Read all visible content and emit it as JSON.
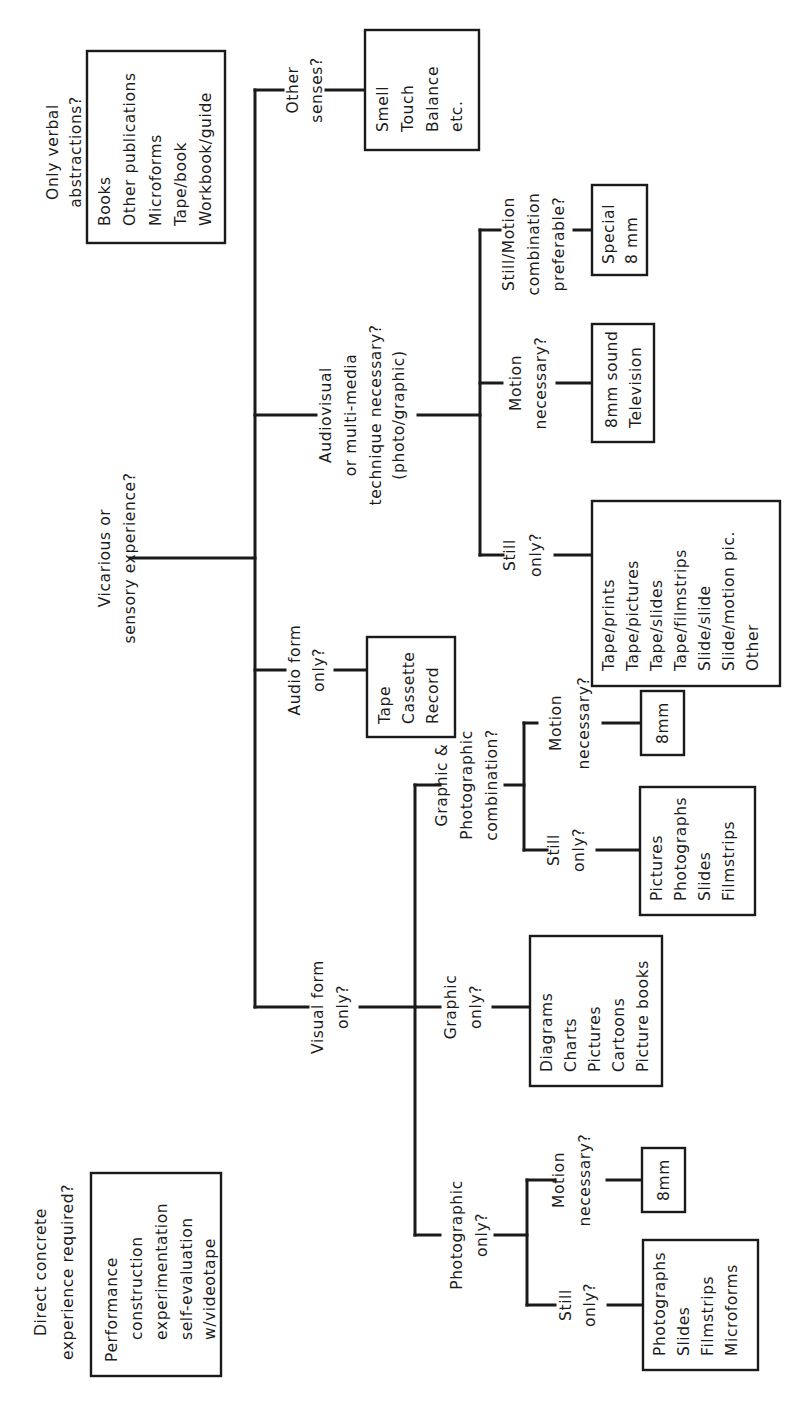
{
  "diagram": {
    "orientation": "rotated -90deg (text reads bottom-to-top)",
    "colors": {
      "ink": "#1a1a1a",
      "background": "#ffffff"
    },
    "questions": {
      "direct": [
        "Direct concrete",
        "experience required?"
      ],
      "vicarious": [
        "Vicarious or",
        "sensory experience?"
      ],
      "verbal": [
        "Only verbal",
        "abstractions?"
      ],
      "visual": [
        "Visual form",
        "only?"
      ],
      "audio": [
        "Audio form",
        "only?"
      ],
      "audiovisual": [
        "Audiovisual",
        "or multi-media",
        "technique necessary?",
        "(photo/graphic)"
      ],
      "other_senses": [
        "Other",
        "senses?"
      ],
      "photographic": [
        "Photographic",
        "only?"
      ],
      "graphic": [
        "Graphic",
        "only?"
      ],
      "graphic_photo": [
        "Graphic &",
        "Photographic",
        "combination?"
      ],
      "photo_still": [
        "Still",
        "only?"
      ],
      "photo_motion": [
        "Motion",
        "necessary?"
      ],
      "gp_still": [
        "Still",
        "only?"
      ],
      "gp_motion": [
        "Motion",
        "necessary?"
      ],
      "av_still": [
        "Still",
        "only?"
      ],
      "av_motion": [
        "Motion",
        "necessary?"
      ],
      "av_combo": [
        "Still/Motion",
        "combination",
        "preferable?"
      ]
    },
    "boxes": {
      "direct": [
        "Performance",
        "construction",
        "experimentation",
        "self-evaluation",
        "w/videotape"
      ],
      "verbal": [
        "Books",
        "Other publications",
        "Microforms",
        "Tape/book",
        "Workbook/guide"
      ],
      "audio": [
        "Tape",
        "Cassette",
        "Record"
      ],
      "other_senses": [
        "Smell",
        "Touch",
        "Balance",
        "etc."
      ],
      "photo_still": [
        "Photographs",
        "Slides",
        "Filmstrips",
        "Microforms"
      ],
      "photo_motion": [
        "8mm"
      ],
      "graphic": [
        "Diagrams",
        "Charts",
        "Pictures",
        "Cartoons",
        "Picture books"
      ],
      "gp_still": [
        "Pictures",
        "Photographs",
        "Slides",
        "Filmstrips"
      ],
      "gp_motion": [
        "8mm"
      ],
      "av_still": [
        "Tape/prints",
        "Tape/pictures",
        "Tape/slides",
        "Tape/filmstrips",
        "Slide/slide",
        "Slide/motion pic.",
        "Other"
      ],
      "av_motion": [
        "8mm sound",
        "Television"
      ],
      "av_combo": [
        "Special",
        "8 mm"
      ]
    }
  }
}
